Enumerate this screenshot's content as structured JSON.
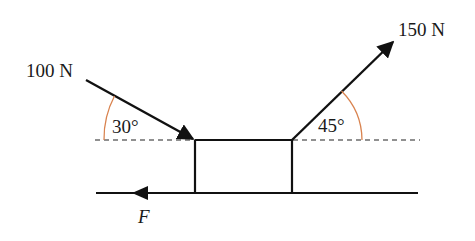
{
  "diagram": {
    "type": "free-body force diagram",
    "colors": {
      "line": "#111111",
      "angle_arc": "#d9834f",
      "background": "#ffffff"
    },
    "forces": [
      {
        "id": "force-100",
        "label": "100 N",
        "magnitude": 100,
        "unit": "N",
        "direction": "down-right onto block",
        "angle_label": "30°",
        "angle_deg": 30
      },
      {
        "id": "force-150",
        "label": "150 N",
        "magnitude": 150,
        "unit": "N",
        "direction": "up-right away from block",
        "angle_label": "45°",
        "angle_deg": 45
      },
      {
        "id": "friction",
        "label": "F",
        "direction": "left along ground"
      }
    ],
    "elements": {
      "block": "rectangular block on ground",
      "reference_line": "horizontal dashed line through top of block",
      "ground": "horizontal ground line"
    }
  }
}
